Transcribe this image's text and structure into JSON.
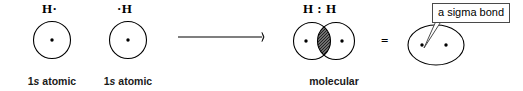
{
  "diagram": {
    "background_color": "#ffffff",
    "stroke_color": "#000000",
    "overlap_fill_color": "#5a5a5a"
  },
  "left_atom": {
    "symbol": "H·",
    "caption_line1": "1s atomic",
    "caption_line1_prefix": "1",
    "caption_line1_italic": "s",
    "caption_line1_suffix": " atomic",
    "caption_line2": "orbital",
    "electron_count": 1
  },
  "right_atom": {
    "symbol": "·H",
    "caption_line1_prefix": "1",
    "caption_line1_italic": "s",
    "caption_line1_suffix": " atomic",
    "caption_line2": "orbital",
    "electron_count": 1
  },
  "reaction_arrow": {
    "name": "reaction-arrow",
    "direction": "right"
  },
  "molecule": {
    "symbol": "H : H",
    "caption_line1": "molecular",
    "caption_line2": "orbital",
    "electron_count": 2
  },
  "equals_sign": {
    "label": "="
  },
  "sigma_representation": {
    "callout_label": "a sigma bond",
    "electron_count": 2
  }
}
